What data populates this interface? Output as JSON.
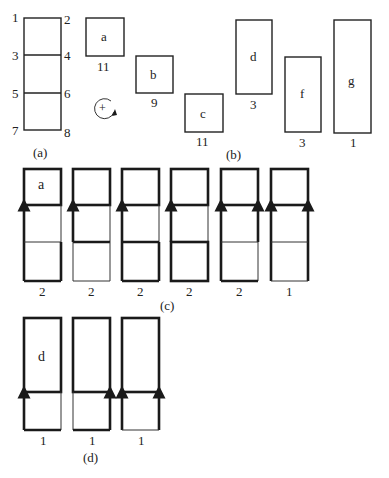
{
  "panels": {
    "a": {
      "label": "(a)",
      "node_labels": [
        "1",
        "2",
        "3",
        "4",
        "5",
        "6",
        "7",
        "8"
      ],
      "rotation_symbol": "+"
    },
    "b": {
      "label": "(b)",
      "pieces": [
        {
          "name": "a",
          "count": "11"
        },
        {
          "name": "b",
          "count": "9"
        },
        {
          "name": "c",
          "count": "11"
        },
        {
          "name": "d",
          "count": "3"
        },
        {
          "name": "f",
          "count": "3"
        },
        {
          "name": "g",
          "count": "1"
        }
      ]
    },
    "c": {
      "label": "(c)",
      "columns": [
        {
          "inner_label": "a",
          "count": "2"
        },
        {
          "inner_label": "",
          "count": "2"
        },
        {
          "inner_label": "",
          "count": "2"
        },
        {
          "inner_label": "",
          "count": "2"
        },
        {
          "inner_label": "",
          "count": "2"
        },
        {
          "inner_label": "",
          "count": "1"
        }
      ]
    },
    "d": {
      "label": "(d)",
      "columns": [
        {
          "inner_label": "d",
          "count": "1"
        },
        {
          "inner_label": "",
          "count": "1"
        },
        {
          "inner_label": "",
          "count": "1"
        }
      ]
    }
  },
  "colors": {
    "ink": "#1a1a1a",
    "background": "#ffffff"
  }
}
